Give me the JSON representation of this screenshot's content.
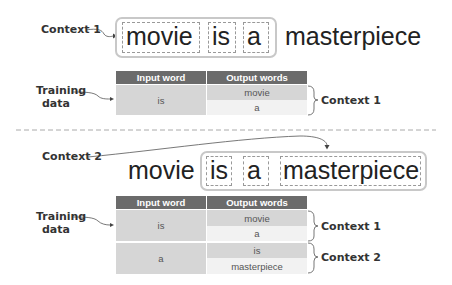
{
  "top": {
    "context_label": "Context 1",
    "sentence_words": [
      "movie",
      "is",
      "a",
      "masterpiece"
    ],
    "training_label": "Training\ndata",
    "table": {
      "headers": [
        "Input word",
        "Output words"
      ],
      "rows": [
        {
          "input": "is",
          "outputs": [
            "movie",
            "a"
          ],
          "context": "Context 1"
        }
      ]
    }
  },
  "bottom": {
    "context_label": "Context 2",
    "sentence_words": [
      "movie",
      "is",
      "a",
      "masterpiece"
    ],
    "training_label": "Training\ndata",
    "table": {
      "headers": [
        "Input word",
        "Output words"
      ],
      "rows": [
        {
          "input": "is",
          "outputs": [
            "movie",
            "a"
          ],
          "context": "Context 1"
        },
        {
          "input": "a",
          "outputs": [
            "is",
            "masterpiece"
          ],
          "context": "Context 2"
        }
      ]
    }
  },
  "colors": {
    "header": "#6b6b6b",
    "cell_dark": "#d6d6d6",
    "cell_light": "#ebebeb",
    "box_border": "#c8c8c8"
  }
}
